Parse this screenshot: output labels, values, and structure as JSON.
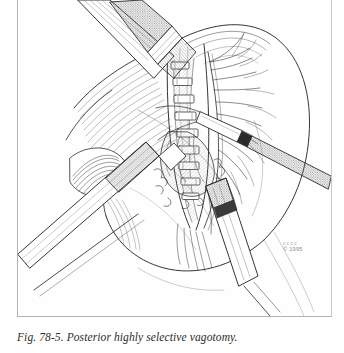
{
  "page": {
    "background_color": "#fefefe",
    "rule_color": "#b3b3b3",
    "width": 344,
    "height": 353
  },
  "figure": {
    "caption": "Fig. 78-5. Posterior highly selective vagotomy.",
    "figure_number": "78-5",
    "title": "Posterior highly selective vagotomy",
    "medium": "pen-and-ink line drawing",
    "ink_color": "#2b2b2b",
    "tone_color": "#9b9b9b"
  },
  "credit": {
    "signature_mark": " ⸺⸺⸺",
    "signature_text": "cccc",
    "copyright": "© 1995",
    "color": "#8d8d8d"
  },
  "scene": {
    "subject": "laparoscopic posterior highly selective vagotomy of the stomach",
    "anatomy": [
      {
        "name": "stomach-body",
        "label": "Stomach body"
      },
      {
        "name": "lesser-curvature",
        "label": "Lesser curvature"
      },
      {
        "name": "esophagus",
        "label": "Distal esophagus"
      },
      {
        "name": "liver-retracted",
        "label": "Retracted liver lobe"
      },
      {
        "name": "vagus-nerve-branches",
        "label": "Posterior vagal branches"
      },
      {
        "name": "vascular-arcade",
        "label": "Gastric vascular arcade"
      },
      {
        "name": "crural-fibers",
        "label": "Diaphragmatic crural fibers"
      }
    ],
    "instruments": [
      {
        "name": "grasper-top",
        "label": "Laparoscopic grasper (superior)"
      },
      {
        "name": "retractor-left",
        "label": "Fan retractor shaft (lower left)"
      },
      {
        "name": "dissector-right",
        "label": "Dissector (right)"
      },
      {
        "name": "clip-applier",
        "label": "Clip applier (lower right)"
      }
    ],
    "clips_applied": 9
  }
}
